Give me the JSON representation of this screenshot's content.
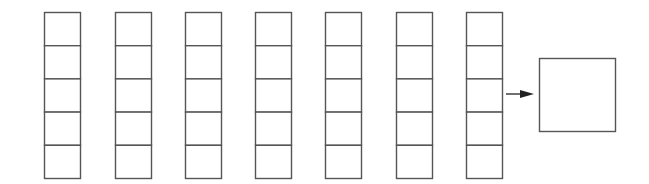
{
  "diagram": {
    "stroke_color": "#555555",
    "background": "#ffffff",
    "stacks": [
      {
        "x": 44,
        "cells": 5
      },
      {
        "x": 115,
        "cells": 5
      },
      {
        "x": 185,
        "cells": 5
      },
      {
        "x": 255,
        "cells": 5
      },
      {
        "x": 325,
        "cells": 5
      },
      {
        "x": 396,
        "cells": 5
      },
      {
        "x": 466,
        "cells": 5
      }
    ],
    "stack_geometry": {
      "y": 12,
      "width": 36,
      "height": 166
    },
    "arrow": {
      "x1": 506,
      "x2": 534,
      "y": 94,
      "direction": "right"
    },
    "output_box": {
      "x": 539,
      "y": 58,
      "width": 76,
      "height": 73
    }
  }
}
